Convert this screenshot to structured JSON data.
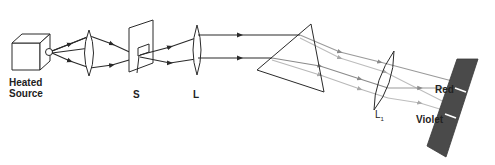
{
  "diagram": {
    "labels": {
      "source_line1": "Heated",
      "source_line2": "Source",
      "slit": "S",
      "lens": "L",
      "lens2": "L",
      "lens2_sub": "1",
      "red": "Red",
      "violet": "Violet"
    },
    "colors": {
      "stroke": "#2a2a2a",
      "ray_dark": "#3a3a3a",
      "ray_light": "#b0b0b0",
      "ray_mid": "#8a8a8a",
      "screen": "#4a4a4a",
      "background": "#ffffff"
    },
    "components": [
      {
        "id": "heated-source",
        "type": "cube"
      },
      {
        "id": "condenser-lens",
        "type": "convex-lens"
      },
      {
        "id": "slit-screen",
        "type": "slit",
        "label": "S"
      },
      {
        "id": "collimating-lens",
        "type": "convex-lens",
        "label": "L"
      },
      {
        "id": "prism",
        "type": "triangular-prism"
      },
      {
        "id": "focusing-lens",
        "type": "convex-lens",
        "label": "L1"
      },
      {
        "id": "viewing-screen",
        "type": "screen",
        "marks": [
          "Red",
          "Violet"
        ]
      }
    ]
  }
}
